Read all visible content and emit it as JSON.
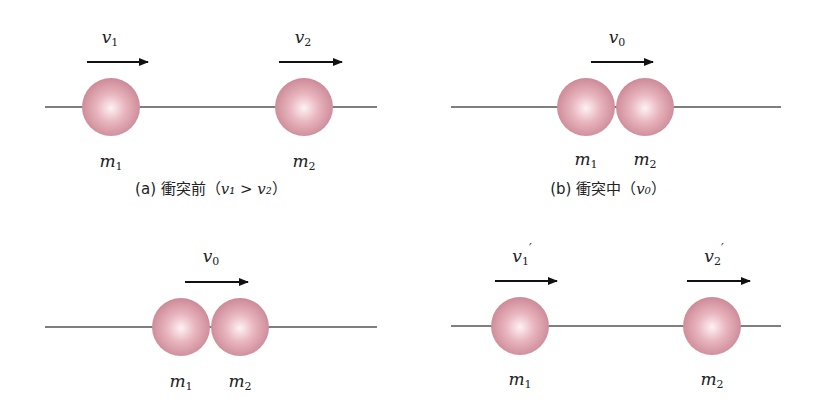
{
  "panels": [
    {
      "id": "a",
      "caption_prefix": "(a) 衝突前（",
      "caption_math": "v₁ > v₂",
      "caption_suffix": "）",
      "track": {
        "x1": 45,
        "x2": 377,
        "y": 107
      },
      "balls": [
        {
          "label": "m",
          "sub": "1",
          "cx": 111,
          "cy": 107,
          "r": 29,
          "lx": 111,
          "ly": 167
        },
        {
          "label": "m",
          "sub": "2",
          "cx": 304,
          "cy": 107,
          "r": 29,
          "lx": 304,
          "ly": 167
        }
      ],
      "arrows": [
        {
          "label": "v",
          "sub": "1",
          "prime": "",
          "x1": 87,
          "x2": 148,
          "y": 62,
          "lx": 110,
          "ly": 43
        },
        {
          "label": "v",
          "sub": "2",
          "prime": "",
          "x1": 279,
          "x2": 342,
          "y": 62,
          "lx": 303,
          "ly": 43
        }
      ],
      "caption_x": 211,
      "caption_y": 194
    },
    {
      "id": "b",
      "caption_prefix": "(b) 衝突中（",
      "caption_math": "v₀",
      "caption_suffix": "）",
      "track": {
        "x1": 451,
        "x2": 781,
        "y": 107
      },
      "balls": [
        {
          "label": "m",
          "sub": "1",
          "cx": 586,
          "cy": 107,
          "r": 29,
          "lx": 586,
          "ly": 165
        },
        {
          "label": "m",
          "sub": "2",
          "cx": 645,
          "cy": 107,
          "r": 29,
          "lx": 645,
          "ly": 165
        }
      ],
      "arrows": [
        {
          "label": "v",
          "sub": "0",
          "prime": "",
          "x1": 591,
          "x2": 653,
          "y": 62,
          "lx": 617,
          "ly": 43
        }
      ],
      "caption_x": 608,
      "caption_y": 194
    },
    {
      "id": "c",
      "caption_prefix": "",
      "caption_math": "",
      "caption_suffix": "",
      "track": {
        "x1": 45,
        "x2": 377,
        "y": 327
      },
      "balls": [
        {
          "label": "m",
          "sub": "1",
          "cx": 181,
          "cy": 327,
          "r": 29,
          "lx": 181,
          "ly": 387
        },
        {
          "label": "m",
          "sub": "2",
          "cx": 240,
          "cy": 327,
          "r": 29,
          "lx": 240,
          "ly": 387
        }
      ],
      "arrows": [
        {
          "label": "v",
          "sub": "0",
          "prime": "",
          "x1": 185,
          "x2": 248,
          "y": 282,
          "lx": 211,
          "ly": 262
        }
      ],
      "caption_x": 211,
      "caption_y": 400
    },
    {
      "id": "d",
      "caption_prefix": "",
      "caption_math": "",
      "caption_suffix": "",
      "track": {
        "x1": 451,
        "x2": 781,
        "y": 326
      },
      "balls": [
        {
          "label": "m",
          "sub": "1",
          "cx": 520,
          "cy": 326,
          "r": 29,
          "lx": 520,
          "ly": 385
        },
        {
          "label": "m",
          "sub": "2",
          "cx": 712,
          "cy": 326,
          "r": 29,
          "lx": 712,
          "ly": 385
        }
      ],
      "arrows": [
        {
          "label": "v",
          "sub": "1",
          "prime": "′",
          "x1": 495,
          "x2": 557,
          "y": 281,
          "lx": 522,
          "ly": 262
        },
        {
          "label": "v",
          "sub": "2",
          "prime": "′",
          "x1": 687,
          "x2": 750,
          "y": 281,
          "lx": 714,
          "ly": 262
        }
      ],
      "caption_x": 608,
      "caption_y": 400
    }
  ],
  "colors": {
    "ball_highlight": "#fdf2f4",
    "ball_mid": "#e3a7b2",
    "ball_edge": "#c37e8c",
    "track": "#555555",
    "arrow": "#111111"
  }
}
